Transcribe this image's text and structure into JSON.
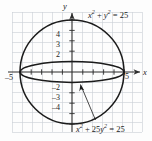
{
  "figure": {
    "kind": "math-graph",
    "background": "#fdfdfd",
    "grid_color": "#c9cfd6",
    "curve_color": "#1b1b1b",
    "axis_color": "#3a3a3a",
    "grid_spacing_px": 10,
    "origin_px": {
      "x": 72,
      "y": 72
    },
    "unit_px": 10.4
  },
  "axes": {
    "x_label": "x",
    "y_label": "y",
    "x_ticks_labeled": [
      {
        "value": -5,
        "text": "–5"
      },
      {
        "value": 5,
        "text": "5"
      }
    ],
    "y_ticks_labeled": [
      {
        "value": 4,
        "text": "4"
      },
      {
        "value": 3,
        "text": "3"
      },
      {
        "value": 2,
        "text": "2"
      },
      {
        "value": -2,
        "text": "–2"
      },
      {
        "value": -3,
        "text": "–3"
      },
      {
        "value": -4,
        "text": "–4"
      }
    ]
  },
  "labels": {
    "circle": {
      "parts": [
        {
          "t": "x",
          "s": "i"
        },
        {
          "t": "2",
          "s": "sup"
        },
        {
          "t": " + ",
          "s": "r"
        },
        {
          "t": "y",
          "s": "i"
        },
        {
          "t": "2",
          "s": "sup"
        },
        {
          "t": " = 25",
          "s": "r"
        }
      ],
      "plain": "x2 + y2 = 25"
    },
    "ellipse": {
      "parts": [
        {
          "t": "x",
          "s": "i"
        },
        {
          "t": "2",
          "s": "sup"
        },
        {
          "t": " + 25",
          "s": "r"
        },
        {
          "t": "y",
          "s": "i"
        },
        {
          "t": "2",
          "s": "sup"
        },
        {
          "t": " = 25",
          "s": "r"
        }
      ],
      "plain": "x2 + 25y2 = 25"
    }
  },
  "chart_data": {
    "type": "line",
    "title": "",
    "xlabel": "x",
    "ylabel": "y",
    "xlim": [
      -7,
      7
    ],
    "ylim": [
      -6.5,
      6.5
    ],
    "grid": true,
    "legend": "none",
    "series": [
      {
        "name": "x^2 + y^2 = 25",
        "shape": "circle",
        "center": [
          0,
          0
        ],
        "radius": 5,
        "x_intercepts": [
          -5,
          5
        ],
        "y_intercepts": [
          -5,
          5
        ],
        "annotation": "x2 + y2 = 25"
      },
      {
        "name": "x^2 + 25y^2 = 25",
        "shape": "ellipse",
        "center": [
          0,
          0
        ],
        "semi_major_a": 5,
        "semi_minor_b": 1,
        "x_intercepts": [
          -5,
          5
        ],
        "y_intercepts": [
          -1,
          1
        ],
        "annotation": "x2 + 25y2 = 25"
      }
    ],
    "intersections": [
      [
        -5,
        0
      ],
      [
        5,
        0
      ]
    ],
    "annotations": [
      {
        "text": "x2 + y2 = 25",
        "at": [
          2.4,
          5.8
        ],
        "points_to": null
      },
      {
        "text": "x2 + 25y2 = 25",
        "at": [
          1.8,
          -5.6
        ],
        "points_to": [
          0.9,
          -0.45
        ]
      }
    ]
  }
}
